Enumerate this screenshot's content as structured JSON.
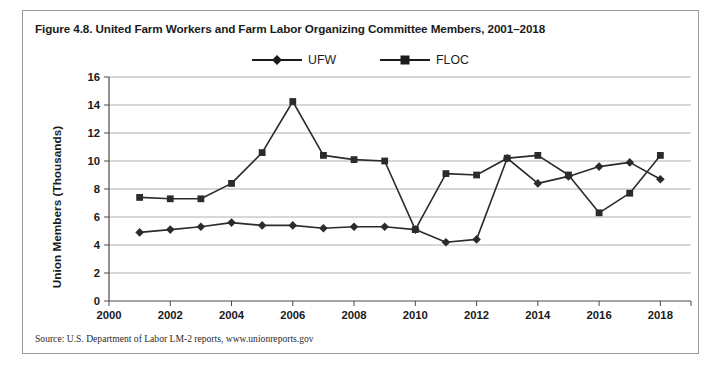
{
  "figure": {
    "title": "Figure 4.8. United Farm Workers and Farm Labor Organizing Committee Members, 2001–2018",
    "source": "Source: U.S. Department of Labor LM-2 reports, www.unionreports.gov"
  },
  "legend": {
    "items": [
      {
        "label": "UFW",
        "marker": "diamond",
        "color": "#1b1b1b"
      },
      {
        "label": "FLOC",
        "marker": "square",
        "color": "#1b1b1b"
      }
    ]
  },
  "colors": {
    "line": "#2b2b2b",
    "grid": "#b0b0b0",
    "axis": "#4a4a4a",
    "border": "#9a9a9a",
    "text": "#1b1b1b"
  },
  "chart_data": {
    "type": "line",
    "title": "United Farm Workers and Farm Labor Organizing Committee Members, 2001–2018",
    "xlabel": "",
    "ylabel": "Union Members (Thousands)",
    "xlim": [
      2000,
      2019
    ],
    "ylim": [
      0,
      16
    ],
    "ytick_step": 2,
    "yticks": [
      0,
      2,
      4,
      6,
      8,
      10,
      12,
      14,
      16
    ],
    "xticks": [
      2000,
      2002,
      2004,
      2006,
      2008,
      2010,
      2012,
      2014,
      2016,
      2018
    ],
    "grid": true,
    "legend_position": "top-center",
    "x": [
      2001,
      2002,
      2003,
      2004,
      2005,
      2006,
      2007,
      2008,
      2009,
      2010,
      2011,
      2012,
      2013,
      2014,
      2015,
      2016,
      2017,
      2018
    ],
    "series": [
      {
        "name": "UFW",
        "marker": "diamond",
        "values": [
          4.9,
          5.1,
          5.3,
          5.6,
          5.4,
          5.4,
          5.2,
          5.3,
          5.3,
          5.1,
          4.2,
          4.4,
          10.2,
          8.4,
          8.9,
          9.6,
          9.9,
          8.7
        ]
      },
      {
        "name": "FLOC",
        "marker": "square",
        "values": [
          7.4,
          7.3,
          7.3,
          8.4,
          10.6,
          14.25,
          10.4,
          10.1,
          10.0,
          5.1,
          9.1,
          9.0,
          10.2,
          10.4,
          9.0,
          6.3,
          7.7,
          10.4
        ]
      }
    ]
  }
}
